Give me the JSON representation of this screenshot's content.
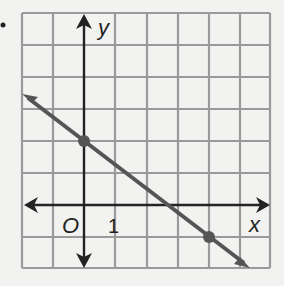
{
  "graph": {
    "bullet": "•",
    "x_axis_label": "x",
    "y_axis_label": "y",
    "origin_label": "O",
    "tick_label": "1",
    "grid": {
      "x_min": -2,
      "x_max": 6,
      "y_min": -2,
      "y_max": 6
    },
    "line": {
      "slope": -0.75,
      "y_intercept": 2,
      "color": "#555555"
    },
    "points": [
      {
        "x": 0,
        "y": 2
      },
      {
        "x": 4,
        "y": -1
      }
    ],
    "grid_color": "#9a9a9a",
    "axis_color": "#222222"
  }
}
